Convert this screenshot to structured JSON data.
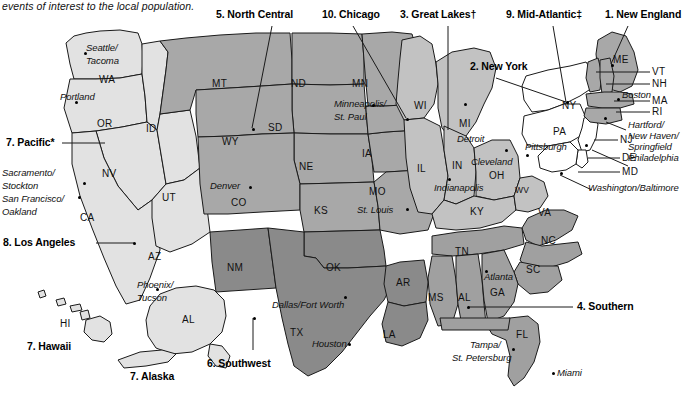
{
  "page": {
    "caption_text": "events of interest to the local population.",
    "width": 696,
    "height": 402
  },
  "colors": {
    "region_pacific": "#e2e2e2",
    "region_north_central": "#a8a8a8",
    "region_great_lakes": "#c2c2c2",
    "region_southern": "#a0a0a0",
    "region_southwest": "#8a8a8a",
    "region_new_england": "#a8a8a8",
    "region_mid_atlantic": "#ffffff",
    "region_chicago": "#b5b5b5",
    "outline": "#1a1a1a",
    "separator": "#ffffff",
    "label_text": "#111111"
  },
  "regions": [
    {
      "number": "1.",
      "name": "New England",
      "label": "1. New England",
      "shade": "#a8a8a8"
    },
    {
      "number": "2.",
      "name": "New York",
      "label": "2. New York",
      "shade": "#ffffff"
    },
    {
      "number": "3.",
      "name": "Great Lakes†",
      "label": "3. Great Lakes†",
      "shade": "#c2c2c2"
    },
    {
      "number": "4.",
      "name": "Southern",
      "label": "4. Southern",
      "shade": "#a0a0a0"
    },
    {
      "number": "5.",
      "name": "North Central",
      "label": "5. North Central",
      "shade": "#a8a8a8"
    },
    {
      "number": "6.",
      "name": "Southwest",
      "label": "6. Southwest",
      "shade": "#8a8a8a"
    },
    {
      "number": "7.",
      "name": "Pacific*",
      "label": "7. Pacific*",
      "shade": "#e2e2e2"
    },
    {
      "number": "7.",
      "name": "Hawaii",
      "label": "7. Hawaii",
      "shade": "#e2e2e2"
    },
    {
      "number": "7.",
      "name": "Alaska",
      "label": "7. Alaska",
      "shade": "#e2e2e2"
    },
    {
      "number": "8.",
      "name": "Los Angeles",
      "label": "8. Los Angeles",
      "shade": "#e2e2e2"
    },
    {
      "number": "9.",
      "name": "Mid-Atlantic‡",
      "label": "9. Mid-Atlantic‡",
      "shade": "#ffffff"
    },
    {
      "number": "10.",
      "name": "Chicago",
      "label": "10. Chicago",
      "shade": "#b5b5b5"
    }
  ],
  "callouts": {
    "north_central": "5. North Central",
    "chicago": "10. Chicago",
    "great_lakes": "3. Great Lakes†",
    "mid_atlantic": "9. Mid-Atlantic‡",
    "new_england": "1. New England",
    "new_york": "2. New York",
    "pacific": "7. Pacific*",
    "los_angeles": "8. Los Angeles",
    "hawaii": "7. Hawaii",
    "alaska": "7. Alaska",
    "southwest": "6. Southwest",
    "southern": "4. Southern"
  },
  "state_abbr": [
    {
      "id": "WA",
      "label": "WA"
    },
    {
      "id": "OR",
      "label": "OR"
    },
    {
      "id": "ID",
      "label": "ID"
    },
    {
      "id": "NV",
      "label": "NV"
    },
    {
      "id": "CA",
      "label": "CA"
    },
    {
      "id": "UT",
      "label": "UT"
    },
    {
      "id": "AZ",
      "label": "AZ"
    },
    {
      "id": "MT",
      "label": "MT"
    },
    {
      "id": "WY",
      "label": "WY"
    },
    {
      "id": "CO",
      "label": "CO"
    },
    {
      "id": "ND",
      "label": "ND"
    },
    {
      "id": "SD",
      "label": "SD"
    },
    {
      "id": "NE",
      "label": "NE"
    },
    {
      "id": "KS",
      "label": "KS"
    },
    {
      "id": "MN",
      "label": "MN"
    },
    {
      "id": "IA",
      "label": "IA"
    },
    {
      "id": "MO",
      "label": "MO"
    },
    {
      "id": "WI",
      "label": "WI"
    },
    {
      "id": "IL",
      "label": "IL"
    },
    {
      "id": "IN",
      "label": "IN"
    },
    {
      "id": "MI",
      "label": "MI"
    },
    {
      "id": "OH",
      "label": "OH"
    },
    {
      "id": "KY",
      "label": "KY"
    },
    {
      "id": "WV",
      "label": "WV"
    },
    {
      "id": "NM",
      "label": "NM"
    },
    {
      "id": "OK",
      "label": "OK"
    },
    {
      "id": "TX",
      "label": "TX"
    },
    {
      "id": "AR",
      "label": "AR"
    },
    {
      "id": "LA",
      "label": "LA"
    },
    {
      "id": "MS",
      "label": "MS"
    },
    {
      "id": "AL",
      "label": "AL"
    },
    {
      "id": "TN",
      "label": "TN"
    },
    {
      "id": "GA",
      "label": "GA"
    },
    {
      "id": "SC",
      "label": "SC"
    },
    {
      "id": "NC",
      "label": "NC"
    },
    {
      "id": "VA",
      "label": "VA"
    },
    {
      "id": "FL",
      "label": "FL"
    },
    {
      "id": "NY",
      "label": "NY"
    },
    {
      "id": "PA",
      "label": "PA"
    },
    {
      "id": "NJ",
      "label": "NJ"
    },
    {
      "id": "DE",
      "label": "DE"
    },
    {
      "id": "MD",
      "label": "MD"
    },
    {
      "id": "ME",
      "label": "ME"
    },
    {
      "id": "VT",
      "label": "VT"
    },
    {
      "id": "NH",
      "label": "NH"
    },
    {
      "id": "MA",
      "label": "MA"
    },
    {
      "id": "RI",
      "label": "RI"
    },
    {
      "id": "HI",
      "label": "HI"
    },
    {
      "id": "AK",
      "label": "AL"
    }
  ],
  "cities": {
    "seattle_tacoma_1": "Seattle/",
    "seattle_tacoma_2": "Tacoma",
    "portland": "Portland",
    "sacramento_1": "Sacramento/",
    "sacramento_2": "Stockton",
    "sanfrancisco_1": "San Francisco/",
    "sanfrancisco_2": "Oakland",
    "phoenix_1": "Phoenix/",
    "phoenix_2": "Tucson",
    "denver": "Denver",
    "minneapolis_1": "Minneapolis/",
    "minneapolis_2": "St. Paul",
    "st_louis": "St. Louis",
    "detroit": "Detroit",
    "cleveland": "Cleveland",
    "indianapolis": "Indianapolis",
    "pittsburgh": "Pittsburgh",
    "boston": "Boston",
    "hartford_1": "Hartford/",
    "hartford_2": "New Haven/",
    "hartford_3": "Springfield",
    "philadelphia": "Philadelphia",
    "washington_baltimore": "Washington/Baltimore",
    "dallas": "Dallas/Fort Worth",
    "houston": "Houston",
    "atlanta": "Atlanta",
    "tampa_1": "Tampa/",
    "tampa_2": "St. Petersburg",
    "miami": "Miami"
  }
}
